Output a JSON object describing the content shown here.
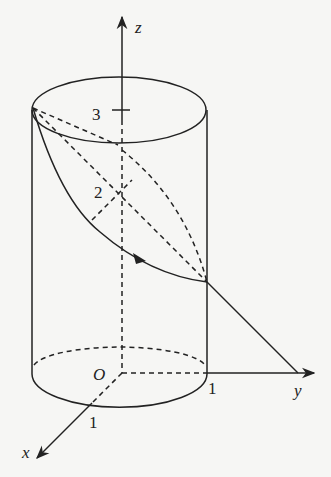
{
  "diagram": {
    "type": "3D cylinder with helix-like curve and coordinate axes",
    "axes": {
      "z": {
        "label": "z"
      },
      "y": {
        "label": "y"
      },
      "x": {
        "label": "x"
      },
      "origin": {
        "label": "O"
      }
    },
    "ticks": {
      "z3": "3",
      "z2": "2",
      "y1": "1",
      "x1": "1"
    },
    "colors": {
      "stroke": "#222222",
      "background": "#f6f6f4"
    }
  }
}
